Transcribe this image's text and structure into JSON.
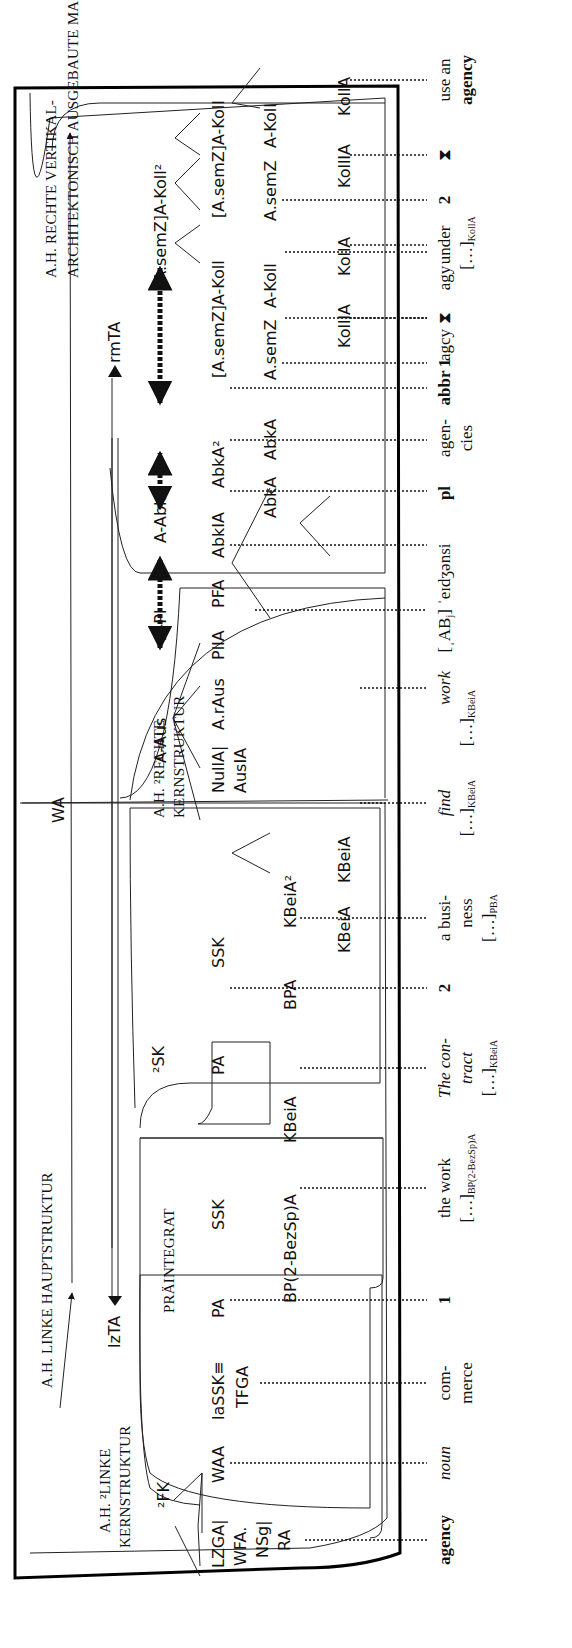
{
  "diagram": {
    "title_structures": {
      "left_main": "A.H. LINKE HAUPTSTRUKTUR",
      "left_core_line1": "A.H. ²LINKE",
      "left_core_line2": "KERNSTRUKTUR",
      "preintegrate": "PRÄINTEGRAT",
      "right_core_line1": "A.H. ²RECHTE",
      "right_core_line2": "KERNSTRUKTUR",
      "right_margin_line1": "A.H. RECHTE VERTIKAL-",
      "right_margin_line2": "ARCHITEKTONISCH AUSGEBAUTE MARGINALSTRUKTUR"
    },
    "nodes": {
      "WA": "WA",
      "lzTA": "lzTA",
      "rmTA": "rmTA",
      "FK2": "²FK",
      "SK2": "²SK",
      "LZGA": "LZGA|",
      "WFA": "WFA.",
      "NSg": "NSg|",
      "RA": "RA",
      "WAA": "WAA",
      "laSSK": "laSSK≡",
      "TFGA": "TFGA",
      "PA1": "PA",
      "SSK1": "SSK",
      "BP2BezSpA": "BP(2-BezSp)A",
      "KBeiA1": "KBeiA",
      "PA2": "PA",
      "SSK2": "SSK",
      "BPA": "BPA",
      "KBeiA2sup": "KBeiA²",
      "KBeiA2": "KBeiA",
      "KBeiA3": "KBeiA",
      "A_Aus": "A-Aus",
      "NullA": "NullA|",
      "AusIA": "AusIA",
      "A_rAus": "A.rAus",
      "A_Pl": "A-Pl",
      "PlIA": "PlIA",
      "PFA": "PFA",
      "A_Abk": "A-Abk",
      "AbkIA": "AbkIA",
      "AbkA2sup": "AbkA²",
      "AbkA1": "AbkA",
      "AbkA2": "AbkA",
      "A_semZ_A_Koll2": "[A.semZ]A-Koll²",
      "A_semZ_A_Koll_1": "[A.semZ]A-Koll",
      "A_semZ_A_Koll_2": "[A.semZ]A-Koll",
      "A_semZ_1": "A.semZ",
      "A_Koll_1": "A-Koll",
      "A_semZ_2": "A.semZ",
      "A_Koll_2": "A-Koll",
      "KollIA_1": "KollIA",
      "Koll_1": "KollA",
      "KollIA_2": "KollIA",
      "Koll_2": "KollA"
    },
    "article_text": [
      {
        "id": "agency",
        "line1": "agency",
        "style": "bold"
      },
      {
        "id": "noun",
        "line1": "noun",
        "style": "italic"
      },
      {
        "id": "commerce",
        "line1": "com-",
        "line2": "merce"
      },
      {
        "id": "num1",
        "line1": "1",
        "style": "bold"
      },
      {
        "id": "thework",
        "line1": "the work",
        "line2": "[…]",
        "sub2": "BP(2-BezSp)A"
      },
      {
        "id": "contract",
        "line1": "The con-",
        "line2": "tract",
        "line3": "[…]",
        "sub3": "KBeiA",
        "style": "italic"
      },
      {
        "id": "num2",
        "line1": "2",
        "style": "bold"
      },
      {
        "id": "business",
        "line1": "a busi-",
        "line2": "ness",
        "line3": "[…]",
        "sub3": "PBA"
      },
      {
        "id": "find",
        "line1": "find",
        "line2": "[…]",
        "sub2": "KBeiA",
        "style": "italic"
      },
      {
        "id": "work",
        "line1": "work",
        "line2": "[…]",
        "sub2": "KBeiA",
        "style": "italic"
      },
      {
        "id": "pron",
        "line1": "[ˌAB",
        "sub1": "j",
        "tail1": "] ˈeɪdʒənsi"
      },
      {
        "id": "pl",
        "line1": "pl",
        "style": "bold"
      },
      {
        "id": "agencies",
        "line1": "agen-",
        "line2": "cies"
      },
      {
        "id": "abbr",
        "line1": "abbr",
        "style": "bold"
      },
      {
        "id": "agcy",
        "line1": "agcy"
      },
      {
        "id": "agy",
        "line1": "agy"
      },
      {
        "id": "sense1",
        "line1": "1",
        "style": "bold"
      },
      {
        "id": "tri1",
        "line1": "⧗"
      },
      {
        "id": "under",
        "line1": "under",
        "line2": "[…]",
        "sub2": "KollA"
      },
      {
        "id": "sense2",
        "line1": "2",
        "style": "bold"
      },
      {
        "id": "tri2",
        "line1": "⧗"
      },
      {
        "id": "usean",
        "line1": "use an",
        "line2": "agency",
        "style2": "bold"
      }
    ]
  }
}
